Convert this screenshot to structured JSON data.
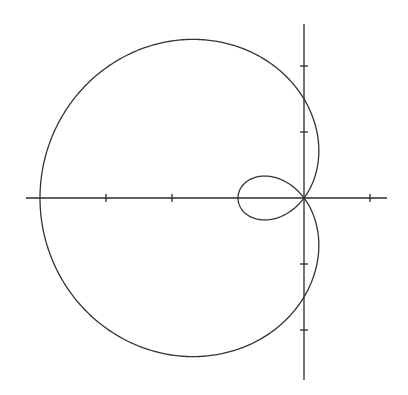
{
  "chart_data": {
    "type": "line",
    "subtype": "polar-curve",
    "title": "",
    "equation": "r = 1.5 - 2.5cos(θ)",
    "params": {
      "a": 1.5,
      "b": 2.5
    },
    "xlabel": "",
    "ylabel": "",
    "xlim": [
      -4.2,
      1.3
    ],
    "ylim": [
      -2.8,
      2.6
    ],
    "x_ticks": [
      -3,
      -2,
      1
    ],
    "y_ticks": [
      -2,
      -1,
      1,
      2
    ],
    "tick_labels_shown": false,
    "grid": false,
    "legend": null,
    "key_points": [
      {
        "label": "leftmost",
        "x": -4,
        "y": 0
      },
      {
        "label": "inner-loop-left",
        "x": -1,
        "y": 0
      },
      {
        "label": "y-intercept-top",
        "x": 0,
        "y": 1.5
      },
      {
        "label": "y-intercept-bottom",
        "x": 0,
        "y": -1.5
      },
      {
        "label": "pole",
        "x": 0,
        "y": 0
      }
    ]
  },
  "layout": {
    "origin_px": [
      304,
      198
    ],
    "unit_px": 66,
    "x_axis_px": [
      26,
      387
    ],
    "y_axis_px": [
      24,
      380
    ],
    "curve_color": "#333333",
    "axis_color": "#2a2a2a"
  }
}
